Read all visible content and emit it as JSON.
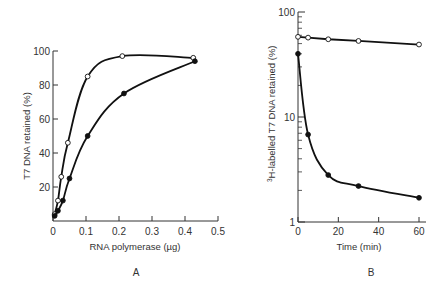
{
  "chart_data": [
    {
      "panel": "A",
      "type": "line",
      "title": "",
      "xlabel": "RNA polymerase (µg)",
      "ylabel": "T7 DNA retained (%)",
      "xlim": [
        0,
        0.5
      ],
      "ylim": [
        0,
        100
      ],
      "xticks": [
        "0",
        "0.1",
        "0.2",
        "0.3",
        "0.4",
        "0.5"
      ],
      "yticks": [
        "20",
        "40",
        "60",
        "80",
        "100"
      ],
      "grid": false,
      "legend": null,
      "series": [
        {
          "name": "open circles",
          "marker": "open-circle",
          "x": [
            0.005,
            0.015,
            0.025,
            0.045,
            0.105,
            0.21,
            0.425
          ],
          "y": [
            4,
            12,
            26,
            46,
            85,
            97,
            96
          ]
        },
        {
          "name": "filled circles",
          "marker": "filled-circle",
          "x": [
            0.005,
            0.015,
            0.03,
            0.05,
            0.105,
            0.215,
            0.43
          ],
          "y": [
            3,
            6,
            12,
            25,
            50,
            75,
            94
          ]
        }
      ]
    },
    {
      "panel": "B",
      "type": "line",
      "title": "",
      "xlabel": "Time (min)",
      "ylabel": "³H-labelled T7 DNA retained (%)",
      "yscale": "log",
      "xlim": [
        0,
        60
      ],
      "ylim": [
        1,
        100
      ],
      "xticks": [
        "0",
        "20",
        "40",
        "60"
      ],
      "yticks": [
        "1",
        "10",
        "100"
      ],
      "grid": false,
      "legend": null,
      "series": [
        {
          "name": "open circles",
          "marker": "open-circle",
          "x": [
            0,
            5,
            15,
            30,
            60
          ],
          "y": [
            58,
            57,
            55,
            53,
            49
          ]
        },
        {
          "name": "filled circles",
          "marker": "filled-circle",
          "x": [
            0,
            5,
            15,
            30,
            60
          ],
          "y": [
            40,
            6.8,
            2.8,
            2.2,
            1.7
          ]
        }
      ]
    }
  ],
  "labels": {
    "panelA": "A",
    "panelB": "B",
    "a_xlabel": "RNA polymerase (µg)",
    "a_ylabel": "T7 DNA retained (%)",
    "b_xlabel": "Time (min)",
    "b_ylabel_sup": "3",
    "b_ylabel": "H-labelled T7 DNA retained (%)"
  },
  "style": {
    "line_color": "#111111",
    "axis_color": "#333333"
  }
}
